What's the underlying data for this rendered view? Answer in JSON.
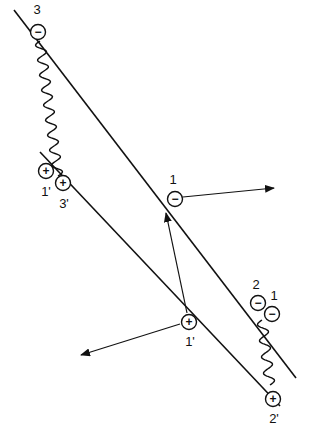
{
  "diagram": {
    "lines": [
      {
        "name": "upper-line",
        "from": [
          14,
          10
        ],
        "to": [
          296,
          378
        ]
      },
      {
        "name": "lower-line",
        "from": [
          40,
          152
        ],
        "to": [
          280,
          406
        ]
      }
    ],
    "charges": [
      {
        "id": "c3",
        "sign": "−",
        "label": "3",
        "cx": 38,
        "cy": 32,
        "lx": 37,
        "ly": 14
      },
      {
        "id": "c1p-left",
        "sign": "+",
        "label": "1'",
        "cx": 46,
        "cy": 171,
        "lx": 46,
        "ly": 196
      },
      {
        "id": "c3p",
        "sign": "+",
        "label": "3'",
        "cx": 63,
        "cy": 183,
        "lx": 64,
        "ly": 208
      },
      {
        "id": "c1-mid",
        "sign": "−",
        "label": "1",
        "cx": 175,
        "cy": 199,
        "lx": 173,
        "ly": 184
      },
      {
        "id": "c1p-mid",
        "sign": "+",
        "label": "1'",
        "cx": 189,
        "cy": 322,
        "lx": 190,
        "ly": 346
      },
      {
        "id": "c2",
        "sign": "−",
        "label": "2",
        "cx": 258,
        "cy": 303,
        "lx": 256,
        "ly": 289
      },
      {
        "id": "c1-right",
        "sign": "−",
        "label": "1",
        "cx": 272,
        "cy": 314,
        "lx": 274,
        "ly": 300
      },
      {
        "id": "c2p",
        "sign": "+",
        "label": "2'",
        "cx": 273,
        "cy": 399,
        "lx": 274,
        "ly": 423
      }
    ],
    "arrows": [
      {
        "name": "arrow-from-1-right",
        "from": [
          183,
          197
        ],
        "to": [
          274,
          188
        ]
      },
      {
        "name": "arrow-from-1p-up",
        "from": [
          187,
          313
        ],
        "to": [
          166,
          213
        ]
      },
      {
        "name": "arrow-from-1p-left",
        "from": [
          180,
          324
        ],
        "to": [
          81,
          355
        ]
      }
    ],
    "springs": [
      {
        "name": "spring-3-to-3p",
        "from": [
          40,
          41
        ],
        "to": [
          58,
          176
        ]
      },
      {
        "name": "spring-2-to-2p",
        "from": [
          262,
          320
        ],
        "to": [
          270,
          385
        ]
      }
    ]
  }
}
